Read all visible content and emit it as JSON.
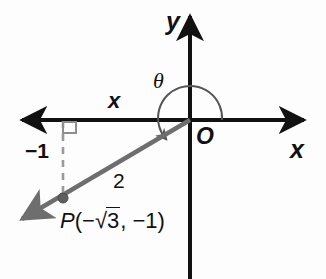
{
  "figure": {
    "axes": {
      "y_label": "y",
      "x_label_right": "x",
      "x_label_negative": "x",
      "origin_label": "O"
    },
    "angle": {
      "symbol": "θ",
      "arc_description": "arc from positive x-axis counterclockwise to terminal ray"
    },
    "measurements": {
      "vertical_leg": "−1",
      "hypotenuse": "2"
    },
    "point": {
      "name": "P",
      "open_paren": "(",
      "x_sign": "−",
      "radical_sign": "√",
      "radicand": "3",
      "separator": ", ",
      "y_value": "−1",
      "close_paren": ")",
      "full_label": "P(−√3, −1)"
    },
    "right_angle_marker": "right-angle square at foot of perpendicular",
    "colors": {
      "axis": "#111111",
      "ray": "#6e6e6e",
      "dashed": "#9a9a9a",
      "arc": "#555555",
      "text": "#111111",
      "background": "#fdfdfd"
    }
  }
}
